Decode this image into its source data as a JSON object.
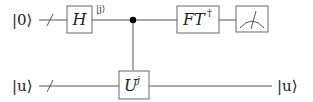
{
  "diagram": {
    "type": "quantum-circuit",
    "colors": {
      "wire": "#555555",
      "box_stroke": "#666666",
      "text": "#222222",
      "control_dot": "#000000"
    },
    "wires": [
      {
        "id": "register",
        "input_label": "|0⟩",
        "bundled": true,
        "output_label": null
      },
      {
        "id": "eigenstate",
        "input_label": "|u⟩",
        "bundled": true,
        "output_label": "|u⟩"
      }
    ],
    "gates": [
      {
        "id": "hadamard",
        "wire": "register",
        "label": "H",
        "superscript": ""
      },
      {
        "id": "controlled-u",
        "wire": "eigenstate",
        "label": "U",
        "superscript": "j",
        "control_wire": "register"
      },
      {
        "id": "inverse-qft",
        "wire": "register",
        "label": "FT",
        "superscript": "†"
      },
      {
        "id": "measurement",
        "wire": "register",
        "label": "measure"
      }
    ],
    "annotations": [
      {
        "id": "state-j",
        "text": "|j⟩",
        "after_gate": "hadamard"
      }
    ]
  }
}
